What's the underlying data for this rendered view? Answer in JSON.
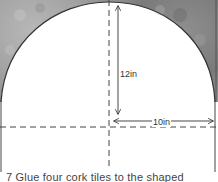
{
  "diagram": {
    "shape": "semicircular arch over rectangle",
    "dimensions": {
      "height_label": "12in",
      "width_label": "10in"
    },
    "colors": {
      "cork_fill": "#9a9a9a",
      "line": "#333333",
      "background": "#ffffff"
    }
  },
  "caption": {
    "text": "7 Glue four cork tiles to the shaped"
  }
}
